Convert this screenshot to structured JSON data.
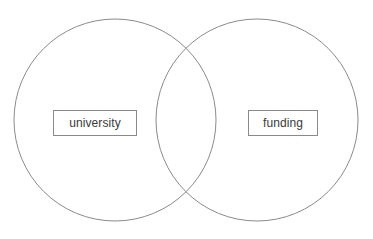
{
  "diagram": {
    "type": "venn",
    "title": "",
    "background_color": "#ffffff",
    "stroke_color": "#8a8a8a",
    "text_color": "#3a3a3a",
    "sets": [
      {
        "id": "left",
        "label": "university",
        "center_x": 115,
        "center_y": 120,
        "radius": 101,
        "label_box": {
          "x": 53,
          "y": 110,
          "width": 84,
          "height": 26
        }
      },
      {
        "id": "right",
        "label": "funding",
        "center_x": 257,
        "center_y": 120,
        "radius": 101,
        "label_box": {
          "x": 248,
          "y": 110,
          "width": 70,
          "height": 26
        }
      }
    ],
    "intersection": {
      "label": "",
      "upper_point_x": 186,
      "upper_point_y": 55,
      "lower_point_x": 186,
      "lower_point_y": 190
    }
  }
}
